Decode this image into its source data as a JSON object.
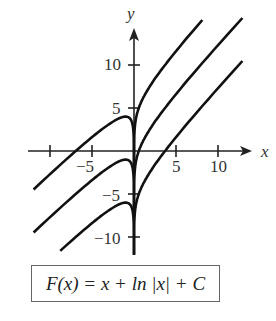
{
  "figure": {
    "formula": "F(x) = x + ln |x| + C",
    "axis_labels": {
      "x": "x",
      "y": "y"
    },
    "x_ticks": [
      {
        "value": -10,
        "label": ""
      },
      {
        "value": -5,
        "label": "−5"
      },
      {
        "value": 5,
        "label": "5"
      },
      {
        "value": 10,
        "label": "10"
      }
    ],
    "y_ticks": [
      {
        "value": 10,
        "label": "10"
      },
      {
        "value": 5,
        "label": "5"
      },
      {
        "value": -5,
        "label": "−5"
      },
      {
        "value": -10,
        "label": "−10"
      }
    ],
    "curve_color": "#111111",
    "axis_color": "#222222"
  },
  "chart_data": {
    "type": "line",
    "title": "F(x) = x + ln |x| + C",
    "xlabel": "x",
    "ylabel": "y",
    "xlim": [
      -13,
      13
    ],
    "ylim": [
      -14,
      16
    ],
    "grid": false,
    "series": [
      {
        "name": "C = 5",
        "function": "x + ln|x| + 5"
      },
      {
        "name": "C = 0",
        "function": "x + ln|x|"
      },
      {
        "name": "C = -5",
        "function": "x + ln|x| - 5"
      }
    ]
  }
}
